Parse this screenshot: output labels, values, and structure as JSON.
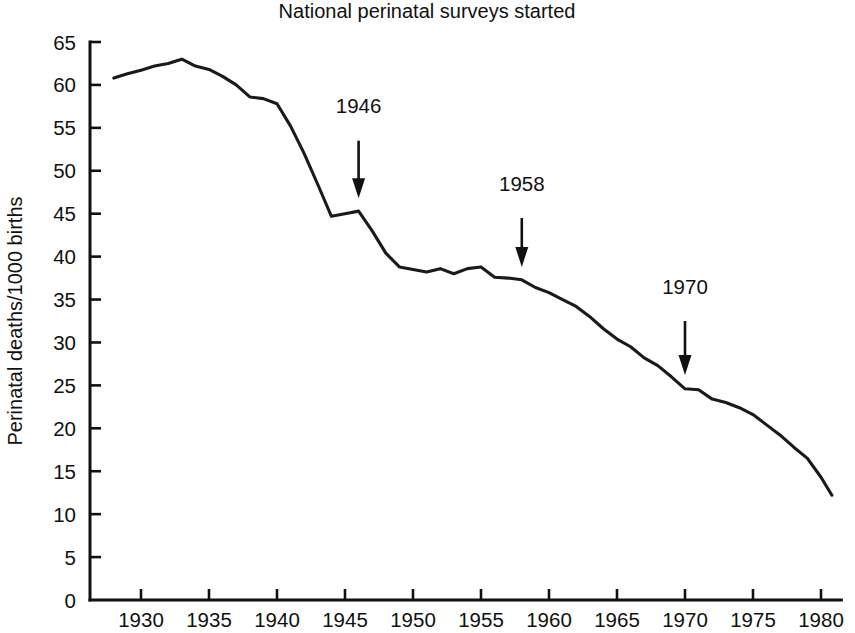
{
  "chart_data": {
    "type": "line",
    "title": "National perinatal surveys started",
    "xlabel": "",
    "ylabel": "Perinatal deaths/1000 births",
    "xlim": [
      1927,
      1981.5
    ],
    "ylim": [
      0,
      65
    ],
    "xticks": [
      1930,
      1935,
      1940,
      1945,
      1950,
      1955,
      1960,
      1965,
      1970,
      1975,
      1980
    ],
    "xtick_labels": [
      "1930",
      "1935",
      "1940",
      "1945",
      "1950",
      "1955",
      "1960",
      "1965",
      "1970",
      "1975",
      "1980"
    ],
    "yticks": [
      0,
      5,
      10,
      15,
      20,
      25,
      30,
      35,
      40,
      45,
      50,
      55,
      60,
      65
    ],
    "ytick_labels": [
      "0",
      "5",
      "10",
      "15",
      "20",
      "25",
      "30",
      "35",
      "40",
      "45",
      "50",
      "55",
      "60",
      "65"
    ],
    "grid": false,
    "legend": null,
    "series": [
      {
        "name": "Perinatal death rate",
        "x": [
          1928.0,
          1929.0,
          1930.0,
          1931.0,
          1932.0,
          1933.0,
          1934.0,
          1935.0,
          1936.0,
          1937.0,
          1938.0,
          1939.0,
          1940.0,
          1941.0,
          1942.0,
          1943.0,
          1944.0,
          1945.0,
          1946.0,
          1947.0,
          1948.0,
          1949.0,
          1950.0,
          1951.0,
          1952.0,
          1953.0,
          1954.0,
          1955.0,
          1956.0,
          1957.0,
          1958.0,
          1959.0,
          1960.0,
          1961.0,
          1962.0,
          1963.0,
          1964.0,
          1965.0,
          1966.0,
          1967.0,
          1968.0,
          1969.0,
          1970.0,
          1971.0,
          1972.0,
          1973.0,
          1974.0,
          1975.0,
          1976.0,
          1977.0,
          1978.0,
          1979.0,
          1980.0,
          1980.8
        ],
        "y": [
          60.8,
          61.3,
          61.7,
          62.2,
          62.5,
          63.0,
          62.2,
          61.8,
          61.0,
          60.0,
          58.6,
          58.4,
          57.8,
          55.2,
          52.0,
          48.4,
          44.7,
          45.0,
          45.3,
          43.0,
          40.4,
          38.8,
          38.5,
          38.2,
          38.6,
          38.0,
          38.6,
          38.8,
          37.6,
          37.5,
          37.3,
          36.4,
          35.8,
          35.0,
          34.2,
          33.0,
          31.6,
          30.4,
          29.5,
          28.2,
          27.3,
          26.0,
          24.6,
          24.5,
          23.4,
          23.0,
          22.4,
          21.6,
          20.4,
          19.2,
          17.8,
          16.5,
          14.3,
          12.2
        ]
      }
    ],
    "annotations": [
      {
        "label": "1946",
        "x": 1946.0,
        "y_from": 53.5,
        "y_to": 46.8,
        "label_x": 1946.0,
        "label_y": 57.6
      },
      {
        "label": "1958",
        "x": 1958.0,
        "y_from": 44.5,
        "y_to": 38.8,
        "label_x": 1958.0,
        "label_y": 48.5
      },
      {
        "label": "1970",
        "x": 1970.0,
        "y_from": 32.5,
        "y_to": 26.2,
        "label_x": 1970.0,
        "label_y": 36.5
      }
    ]
  },
  "colors": {
    "line": "#1a1a1a",
    "axis": "#111111",
    "text": "#111111",
    "background": "#ffffff"
  }
}
